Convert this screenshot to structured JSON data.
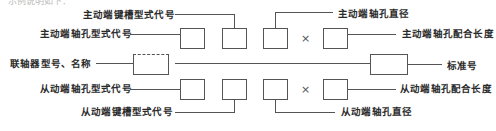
{
  "diagram": {
    "header_cut": "示例说明如下：",
    "labels": {
      "drive_keyway": "主动端键槽型式代号",
      "drive_bore_type": "主动端轴孔型式代号",
      "coupling_model": "联轴器型号、名称",
      "driven_bore_type": "从动端轴孔型式代号",
      "driven_keyway": "从动端键槽型式代号",
      "drive_bore_diameter": "主动端轴孔直径",
      "drive_bore_length": "主动端轴孔配合长度",
      "standard_no": "标准号",
      "driven_bore_length": "从动端轴孔配合长度",
      "driven_bore_diameter": "从动端轴孔直径"
    },
    "times_symbol": "×",
    "colors": {
      "line": "#555555",
      "text": "#2a2a2a"
    }
  }
}
